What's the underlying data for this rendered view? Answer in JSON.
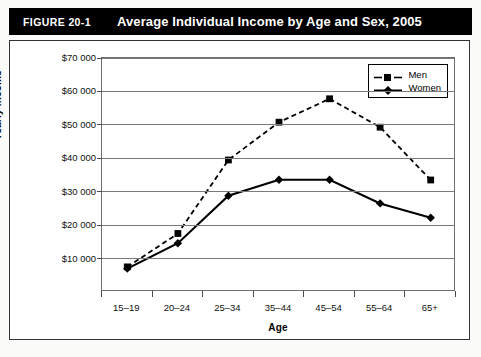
{
  "header": {
    "figure_number": "FIGURE 20-1",
    "title": "Average Individual Income by Age and Sex, 2005",
    "background_color": "#000000",
    "text_color": "#ffffff"
  },
  "chart_data": {
    "type": "line",
    "title": "Average Individual Income by Age and Sex, 2005",
    "xlabel": "Age",
    "ylabel": "Yearly income",
    "categories": [
      "15–19",
      "20–24",
      "25–34",
      "35–44",
      "45–54",
      "55–64",
      "65+"
    ],
    "ylim": [
      0,
      70000
    ],
    "ytick_values": [
      10000,
      20000,
      30000,
      40000,
      50000,
      60000,
      70000
    ],
    "ytick_labels": [
      "$10 000",
      "$20 000",
      "$30 000",
      "$40 000",
      "$50 000",
      "$60 000",
      "$70 000"
    ],
    "grid": true,
    "legend_position": "top-right inside plot",
    "series": [
      {
        "name": "Men",
        "values": [
          7500,
          17500,
          39500,
          50800,
          57800,
          49300,
          33500
        ],
        "line_style": "dashed",
        "marker": "square",
        "color": "#000000"
      },
      {
        "name": "Women",
        "values": [
          7000,
          14600,
          28800,
          33600,
          33600,
          26500,
          22200
        ],
        "line_style": "solid",
        "marker": "diamond",
        "color": "#000000"
      }
    ]
  }
}
